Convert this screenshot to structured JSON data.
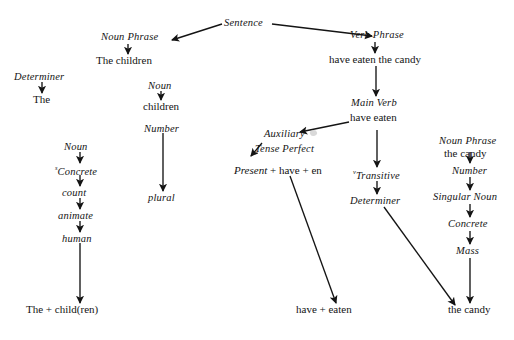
{
  "diagram": {
    "background_color": "#ffffff",
    "ink_color": "#141414",
    "nodes": {
      "sentence": "Sentence",
      "noun_phrase_left": "Noun Phrase",
      "the_children": "The children",
      "verb_phrase": "Verb Phrase",
      "have_eaten_the_candy": "have eaten the candy",
      "determiner_left": "Determiner",
      "the": "The",
      "noun_mid": "Noun",
      "children": "children",
      "number_mid": "Number",
      "plural": "plural",
      "main_verb": "Main Verb",
      "have_eaten": "have eaten",
      "noun_left_low": "Noun",
      "concrete_left_sup": "s",
      "concrete_left": "Concrete",
      "count": "count",
      "animate": "animate",
      "human": "human",
      "the_child_ren": "The + child(ren)",
      "auxiliary": "Auxiliary",
      "tense_perfect": "Tense Perfect",
      "present_italic": "Present",
      "present_rest": "+ have + en",
      "have_plus_eaten": "have + eaten",
      "transitive_sup": "v",
      "transitive": "Transitive",
      "determiner_right": "Determiner",
      "noun_phrase_right": "Noun Phrase",
      "the_candy_top": "the candy",
      "number_right": "Number",
      "singular_noun": "Singular Noun",
      "concrete_right": "Concrete",
      "mass": "Mass",
      "the_candy_bottom": "the candy"
    }
  }
}
